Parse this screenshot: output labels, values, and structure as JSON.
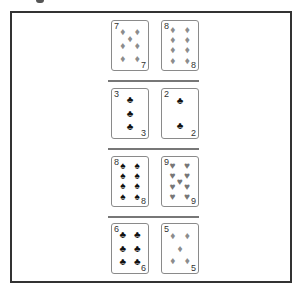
{
  "board": {
    "rows": [
      {
        "cards": [
          {
            "rank": "7",
            "suit": "diamonds"
          },
          {
            "rank": "8",
            "suit": "diamonds"
          }
        ]
      },
      {
        "cards": [
          {
            "rank": "3",
            "suit": "clubs"
          },
          {
            "rank": "2",
            "suit": "clubs"
          }
        ]
      },
      {
        "cards": [
          {
            "rank": "8",
            "suit": "spades"
          },
          {
            "rank": "9",
            "suit": "hearts"
          }
        ]
      },
      {
        "cards": [
          {
            "rank": "6",
            "suit": "clubs"
          },
          {
            "rank": "5",
            "suit": "diamonds"
          }
        ]
      }
    ]
  },
  "suits": {
    "diamonds": {
      "glyph": "♦",
      "color": "#8c8c8c"
    },
    "hearts": {
      "glyph": "♥",
      "color": "#777777"
    },
    "clubs": {
      "glyph": "♣",
      "color": "#111111"
    },
    "spades": {
      "glyph": "♠",
      "color": "#111111"
    }
  }
}
